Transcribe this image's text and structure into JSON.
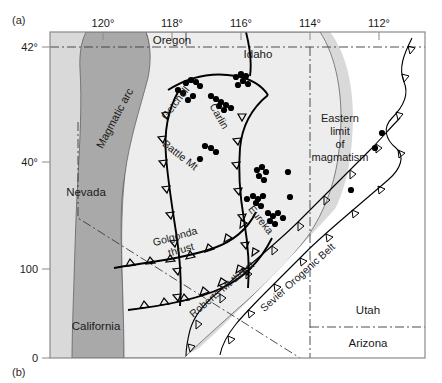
{
  "figure": {
    "panel_a_label": "(a)",
    "panel_b_label": "(b)"
  },
  "axes": {
    "top_ticks": [
      {
        "label": "120°",
        "x": 103
      },
      {
        "label": "118°",
        "x": 172
      },
      {
        "label": "116°",
        "x": 241
      },
      {
        "label": "114°",
        "x": 310
      },
      {
        "label": "112°",
        "x": 379
      }
    ],
    "left_ticks": [
      {
        "label": "42°",
        "y": 47
      },
      {
        "label": "40°",
        "y": 162
      },
      {
        "label": "100",
        "y": 269
      },
      {
        "label": "0",
        "y": 358
      }
    ]
  },
  "regions": [
    {
      "name": "outer-shelf",
      "fill": "#d9d9d9"
    },
    {
      "name": "magmatic-arc-band",
      "fill": "#a9a9a9"
    },
    {
      "name": "inner-basin",
      "fill": "#ededed"
    },
    {
      "name": "craton-white",
      "fill": "#ffffff"
    }
  ],
  "labels": {
    "oregon": "Oregon",
    "idaho": "Idaho",
    "nevada": "Nevada",
    "california": "California",
    "utah": "Utah",
    "arizona": "Arizona",
    "magmatic_arc": "Magmatic arc",
    "getchell": "Getchell",
    "carlin": "Carlin",
    "battle_mt": "Battle Mt",
    "eureka": "Eureka",
    "golconda_thrust_line1": "Golgonda",
    "golconda_thrust_line2": "thrust",
    "roberts_mt_thrust": "Roberts Mt thrust",
    "sevier_orogenic_belt": "Sevier Orogenic Belt",
    "eastern_limit_line1": "Eastern",
    "eastern_limit_line2": "limit",
    "eastern_limit_line3": "of",
    "eastern_limit_line4": "magmatism"
  },
  "colors": {
    "line": "#000000",
    "state_border": "#3a3a3a",
    "deposit_dot": "#000000",
    "frame": "#808080"
  },
  "chart_data": {
    "type": "scatter",
    "xlabel": "Longitude (°W)",
    "ylabel": "Latitude (°N)",
    "xlim": [
      121,
      111
    ],
    "ylim": [
      36.5,
      42.3
    ],
    "grid": false,
    "legend": "none",
    "deposits_px": [
      [
        186,
        83
      ],
      [
        191,
        80
      ],
      [
        196,
        82
      ],
      [
        200,
        86
      ],
      [
        178,
        90
      ],
      [
        183,
        93
      ],
      [
        193,
        96
      ],
      [
        188,
        100
      ],
      [
        236,
        77
      ],
      [
        241,
        74
      ],
      [
        246,
        76
      ],
      [
        243,
        81
      ],
      [
        238,
        85
      ],
      [
        248,
        84
      ],
      [
        211,
        96
      ],
      [
        216,
        99
      ],
      [
        221,
        102
      ],
      [
        226,
        105
      ],
      [
        231,
        108
      ],
      [
        219,
        106
      ],
      [
        224,
        110
      ],
      [
        205,
        146
      ],
      [
        211,
        148
      ],
      [
        216,
        152
      ],
      [
        200,
        159
      ],
      [
        257,
        170
      ],
      [
        262,
        167
      ],
      [
        266,
        172
      ],
      [
        259,
        176
      ],
      [
        264,
        180
      ],
      [
        288,
        172
      ],
      [
        253,
        196
      ],
      [
        258,
        199
      ],
      [
        263,
        196
      ],
      [
        256,
        203
      ],
      [
        261,
        206
      ],
      [
        247,
        199
      ],
      [
        290,
        197
      ],
      [
        268,
        213
      ],
      [
        273,
        216
      ],
      [
        278,
        213
      ],
      [
        283,
        218
      ],
      [
        270,
        221
      ],
      [
        275,
        224
      ],
      [
        351,
        190
      ],
      [
        382,
        133
      ],
      [
        375,
        148
      ]
    ]
  }
}
